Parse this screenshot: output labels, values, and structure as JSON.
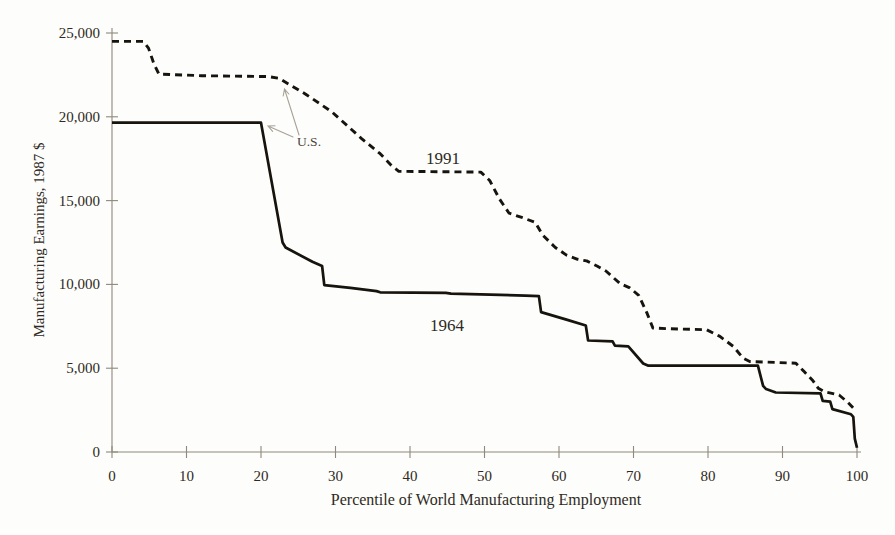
{
  "figure": {
    "background": "#fdfdfb",
    "ink": "#17130d",
    "axis_color": "#8f897c",
    "arrow_color": "#a9a296"
  },
  "chart_data": {
    "type": "line",
    "title": "",
    "xlabel": "Percentile of World Manufacturing Employment",
    "ylabel": "Manufacturing Earnings, 1987 $",
    "xlim": [
      0,
      100
    ],
    "ylim": [
      0,
      25000
    ],
    "grid": false,
    "legend": "inline labels next to curves",
    "x_ticks": [
      {
        "value": 0,
        "label": "0"
      },
      {
        "value": 10,
        "label": "10"
      },
      {
        "value": 20,
        "label": "20"
      },
      {
        "value": 30,
        "label": "30"
      },
      {
        "value": 40,
        "label": "40"
      },
      {
        "value": 50,
        "label": "50"
      },
      {
        "value": 60,
        "label": "60"
      },
      {
        "value": 70,
        "label": "70"
      },
      {
        "value": 80,
        "label": "80"
      },
      {
        "value": 90,
        "label": "90"
      },
      {
        "value": 100,
        "label": "100"
      }
    ],
    "y_ticks": [
      {
        "value": 0,
        "label": "0"
      },
      {
        "value": 5000,
        "label": "5,000"
      },
      {
        "value": 10000,
        "label": "10,000"
      },
      {
        "value": 15000,
        "label": "15,000"
      },
      {
        "value": 20000,
        "label": "20,000"
      },
      {
        "value": 25000,
        "label": "25,000"
      }
    ],
    "series": [
      {
        "name": "1991",
        "style": "dashed",
        "points": [
          [
            0,
            24500
          ],
          [
            4.2,
            24500
          ],
          [
            4.9,
            24100
          ],
          [
            5.6,
            23200
          ],
          [
            6.3,
            22550
          ],
          [
            12,
            22450
          ],
          [
            21,
            22400
          ],
          [
            22.4,
            22300
          ],
          [
            26,
            21350
          ],
          [
            29.5,
            20300
          ],
          [
            33.5,
            18700
          ],
          [
            36,
            17800
          ],
          [
            37.5,
            17100
          ],
          [
            38.5,
            16750
          ],
          [
            49.5,
            16700
          ],
          [
            50.7,
            16200
          ],
          [
            52,
            15100
          ],
          [
            53.3,
            14250
          ],
          [
            55,
            14000
          ],
          [
            56.8,
            13700
          ],
          [
            57.8,
            12950
          ],
          [
            59.5,
            12200
          ],
          [
            61,
            11750
          ],
          [
            62.5,
            11500
          ],
          [
            63.7,
            11400
          ],
          [
            65.1,
            11100
          ],
          [
            66.3,
            10800
          ],
          [
            68.2,
            10050
          ],
          [
            69.5,
            9800
          ],
          [
            70.7,
            9350
          ],
          [
            71.8,
            8300
          ],
          [
            72.6,
            7400
          ],
          [
            75,
            7350
          ],
          [
            79.8,
            7300
          ],
          [
            81.6,
            6900
          ],
          [
            83.4,
            6300
          ],
          [
            84.7,
            5600
          ],
          [
            85.6,
            5400
          ],
          [
            91.8,
            5300
          ],
          [
            92.9,
            4800
          ],
          [
            94.1,
            4250
          ],
          [
            94.8,
            3800
          ],
          [
            95.6,
            3600
          ],
          [
            97.6,
            3400
          ],
          [
            98.8,
            2950
          ],
          [
            99.7,
            2530
          ]
        ]
      },
      {
        "name": "1964",
        "style": "solid",
        "points": [
          [
            0,
            19650
          ],
          [
            20,
            19650
          ],
          [
            22.9,
            12500
          ],
          [
            23.3,
            12200
          ],
          [
            26.9,
            11350
          ],
          [
            28.2,
            11100
          ],
          [
            28.5,
            9950
          ],
          [
            32,
            9800
          ],
          [
            35.5,
            9600
          ],
          [
            36,
            9530
          ],
          [
            44.8,
            9500
          ],
          [
            45.5,
            9450
          ],
          [
            55.5,
            9330
          ],
          [
            57.3,
            9300
          ],
          [
            57.6,
            8350
          ],
          [
            61,
            7900
          ],
          [
            63.6,
            7550
          ],
          [
            63.9,
            6650
          ],
          [
            67.2,
            6600
          ],
          [
            67.5,
            6350
          ],
          [
            69.3,
            6300
          ],
          [
            71.3,
            5280
          ],
          [
            72,
            5150
          ],
          [
            86.7,
            5150
          ],
          [
            87.4,
            3950
          ],
          [
            87.8,
            3750
          ],
          [
            89.1,
            3550
          ],
          [
            95.1,
            3500
          ],
          [
            95.4,
            3050
          ],
          [
            96.4,
            3000
          ],
          [
            96.7,
            2560
          ],
          [
            99.2,
            2250
          ],
          [
            99.5,
            2100
          ],
          [
            99.7,
            800
          ],
          [
            100,
            250
          ]
        ]
      }
    ],
    "annotations": [
      {
        "text": "U.S.",
        "points_to": "both curves near the 20th–23rd percentile"
      }
    ]
  }
}
